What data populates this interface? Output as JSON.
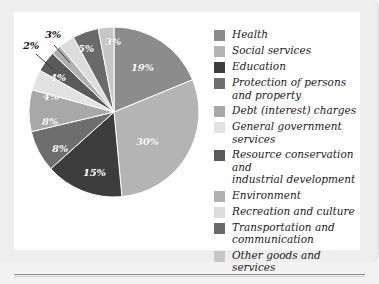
{
  "chart_data": {
    "type": "pie",
    "title": "",
    "subtitle": "",
    "xlabel": "",
    "ylabel": "",
    "legend_position": "right",
    "grid": false,
    "units": "percent",
    "categories": [
      "Health",
      "Social services",
      "Education",
      "Protection of persons and property",
      "Debt (interest) charges",
      "General government services",
      "Resource conservation and industrial development",
      "Environment",
      "Recreation and culture",
      "Transportation and communication",
      "Other goods and services"
    ],
    "values": [
      19,
      30,
      15,
      8,
      8,
      4,
      4,
      2,
      3,
      5,
      3
    ],
    "value_labels": [
      "19%",
      "30%",
      "15%",
      "8%",
      "8%",
      "4%",
      "4%",
      "2%",
      "3%",
      "5%",
      "3%"
    ],
    "colors": [
      "#8c8c8c",
      "#b4b4b4",
      "#3d3d3d",
      "#6e6e6e",
      "#a8a8a8",
      "#e2e2e2",
      "#5a5a5a",
      "#b0b0b0",
      "#dcdcdc",
      "#6a6a6a",
      "#c6c6c6"
    ],
    "start_angle_deg": 0,
    "direction": "clockwise"
  },
  "legend": {
    "items": [
      {
        "label": "Health",
        "color": "#8c8c8c",
        "value": "19%"
      },
      {
        "label": "Social services",
        "color": "#b4b4b4",
        "value": "30%"
      },
      {
        "label": "Education",
        "color": "#3d3d3d",
        "value": "15%"
      },
      {
        "label": "Protection of persons\nand property",
        "color": "#6e6e6e",
        "value": "8%"
      },
      {
        "label": "Debt (interest) charges",
        "color": "#a8a8a8",
        "value": "8%"
      },
      {
        "label": "General government services",
        "color": "#e2e2e2",
        "value": "4%"
      },
      {
        "label": "Resource conservation and\nindustrial development",
        "color": "#5a5a5a",
        "value": "4%"
      },
      {
        "label": "Environment",
        "color": "#b0b0b0",
        "value": "2%"
      },
      {
        "label": "Recreation and culture",
        "color": "#dcdcdc",
        "value": "3%"
      },
      {
        "label": "Transportation and\ncommunication",
        "color": "#6a6a6a",
        "value": "5%"
      },
      {
        "label": "Other goods and services",
        "color": "#c6c6c6",
        "value": "3%"
      }
    ]
  },
  "pie_labels": [
    {
      "text": "19%",
      "x": 117,
      "y": 50,
      "inside": true
    },
    {
      "text": "30%",
      "x": 122,
      "y": 124,
      "inside": true
    },
    {
      "text": "15%",
      "x": 69,
      "y": 155,
      "inside": true
    },
    {
      "text": "8%",
      "x": 38,
      "y": 131,
      "inside": true
    },
    {
      "text": "8%",
      "x": 28,
      "y": 104,
      "inside": true
    },
    {
      "text": "4%",
      "x": 29,
      "y": 79,
      "inside": true
    },
    {
      "text": "4%",
      "x": 36,
      "y": 60,
      "inside": true
    },
    {
      "text": "2%",
      "x": 9,
      "y": 28,
      "inside": false
    },
    {
      "text": "3%",
      "x": 31,
      "y": 17,
      "inside": false
    },
    {
      "text": "5%",
      "x": 64,
      "y": 31,
      "inside": true
    },
    {
      "text": "3%",
      "x": 91,
      "y": 24,
      "inside": true
    }
  ]
}
